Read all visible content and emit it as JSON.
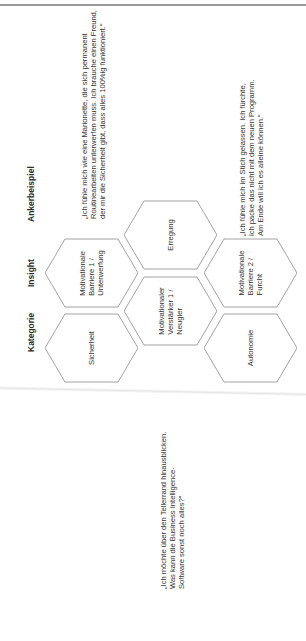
{
  "headers": {
    "category": "Kategorie",
    "insight": "Insight",
    "anchor_example": "Ankerbeispiel"
  },
  "hexagons": [
    {
      "id": "sicherheit",
      "lines": [
        "Sicherheit"
      ]
    },
    {
      "id": "barriere1",
      "lines": [
        "Motivationale",
        "Barriere 1 /",
        "Unterwerfung"
      ]
    },
    {
      "id": "erregung",
      "lines": [
        "Erregung"
      ]
    },
    {
      "id": "verstaerker1",
      "lines": [
        "Motivationaler",
        "Verstärker 1 /",
        "Neugier"
      ]
    },
    {
      "id": "barriere2",
      "lines": [
        "Motivationale",
        "Barriere 2 /",
        "Furcht"
      ]
    },
    {
      "id": "autonomie",
      "lines": [
        "Autonomie"
      ]
    }
  ],
  "quotes": [
    {
      "id": "quote-unterwerfung",
      "lines": [
        "„Ich fühle mich wie eine Marionette, die sich permanent",
        "Routinearbeiten unterwerfen muss. Ich brauche einen Freund,",
        "der mir die Sicherheit gibt, dass alles 100%ig funktioniert.“"
      ]
    },
    {
      "id": "quote-furcht",
      "lines": [
        "„Ich fühle mich im Stich gelassen. Ich fürchte,",
        "ich packe das nicht mit dem neuen Programm.",
        "Am Ende will ich es alleine können.“"
      ]
    },
    {
      "id": "quote-neugier",
      "lines": [
        "„Ich möchte über den Tellerrand hinausblicken.",
        "Was kann die Business Intelligence-",
        "Software sonst noch alles?“"
      ]
    }
  ],
  "colors": {
    "hex_stroke": "#8a8a8a",
    "text": "#333333",
    "topline": "#9a9a9a"
  }
}
